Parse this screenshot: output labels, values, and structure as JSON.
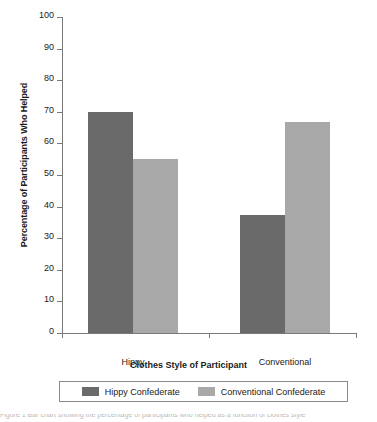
{
  "chart_data": {
    "type": "bar",
    "title": "",
    "xlabel": "Clothes Style of Participant",
    "ylabel": "Percentage of Participants Who Helped",
    "categories": [
      "Hippy",
      "Conventional"
    ],
    "series": [
      {
        "name": "Hippy Confederate",
        "color": "#6a6a6a",
        "values": [
          70,
          37.5
        ]
      },
      {
        "name": "Conventional Confederate",
        "color": "#a8a8a8",
        "values": [
          55,
          66.7
        ]
      }
    ],
    "ylim": [
      0,
      100
    ],
    "ytick_labels": [
      "100",
      "90",
      "80",
      "70",
      "60",
      "50",
      "40",
      "30",
      "20",
      "10",
      "0"
    ],
    "ytick_values": [
      100,
      90,
      80,
      70,
      60,
      50,
      40,
      30,
      20,
      10,
      0
    ],
    "grid": false,
    "legend_position": "bottom"
  },
  "axes": {
    "y_title": "Percentage of Participants Who Helped",
    "x_title": "Clothes Style of Participant"
  },
  "legend": {
    "entries": [
      {
        "label": "Hippy Confederate",
        "swatch": "dark"
      },
      {
        "label": "Conventional Confederate",
        "swatch": "light"
      }
    ]
  },
  "caption": {
    "text": "Figure 1 Bar chart showing the percentage of participants who helped as a function of clothes style"
  }
}
